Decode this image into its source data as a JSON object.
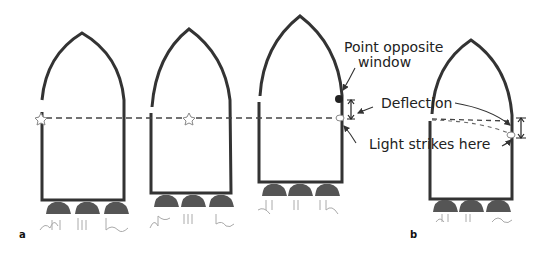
{
  "figure": {
    "panels": [
      {
        "id": "a",
        "label": "a"
      },
      {
        "id": "b",
        "label": "b"
      }
    ],
    "annotations": {
      "point_opposite_line1": "Point opposite",
      "point_opposite_line2": "window",
      "deflection": "Deflection",
      "light_strikes": "Light strikes here"
    },
    "colors": {
      "outline": "#333333",
      "engine": "#555555",
      "dash": "#444444"
    }
  }
}
